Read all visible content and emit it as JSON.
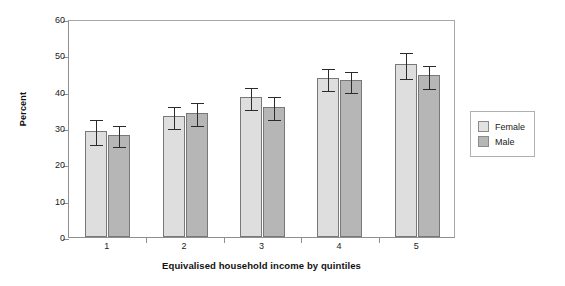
{
  "chart_data": {
    "type": "bar",
    "title": "",
    "xlabel": "Equivalised household income by quintiles",
    "ylabel": "Percent",
    "categories": [
      "1",
      "2",
      "3",
      "4",
      "5"
    ],
    "ylim": [
      0,
      60
    ],
    "yticks": [
      0,
      10,
      20,
      30,
      40,
      50,
      60
    ],
    "ytick_labels": [
      "0",
      "10",
      "20",
      "30",
      "40",
      "50",
      "60"
    ],
    "grid": false,
    "legend_position": "right",
    "series": [
      {
        "name": "Female",
        "color": "#dedede",
        "values": [
          29.3,
          33.3,
          38.4,
          43.7,
          47.6
        ],
        "err_low": [
          3.3,
          3.0,
          3.0,
          3.1,
          3.6
        ],
        "err_high": [
          3.4,
          3.0,
          3.1,
          3.2,
          3.5
        ]
      },
      {
        "name": "Male",
        "color": "#b6b6b6",
        "values": [
          28.2,
          34.2,
          35.9,
          43.1,
          44.6
        ],
        "err_low": [
          2.9,
          3.0,
          3.1,
          2.9,
          3.2
        ],
        "err_high": [
          3.0,
          3.2,
          3.2,
          2.9,
          3.1
        ]
      }
    ]
  },
  "legend": {
    "items": [
      {
        "label": "Female"
      },
      {
        "label": "Male"
      }
    ]
  }
}
